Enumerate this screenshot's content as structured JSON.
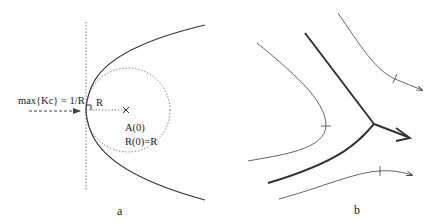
{
  "figure": {
    "panel_a": {
      "label": "a",
      "annotation_max": "max{Kc} = 1/R",
      "radius_label": "R",
      "point_label": "A(0)",
      "radius_eq": "R(0)=R",
      "center_marker": "x-marker-icon",
      "right_angle_marker": "right-angle-icon"
    },
    "panel_b": {
      "label": "b",
      "arrow_icon": "arrowhead-icon"
    },
    "colors": {
      "ink": "#222222",
      "thin_line": "#555555",
      "dotted": "#666666",
      "background": "#ffffff"
    }
  }
}
